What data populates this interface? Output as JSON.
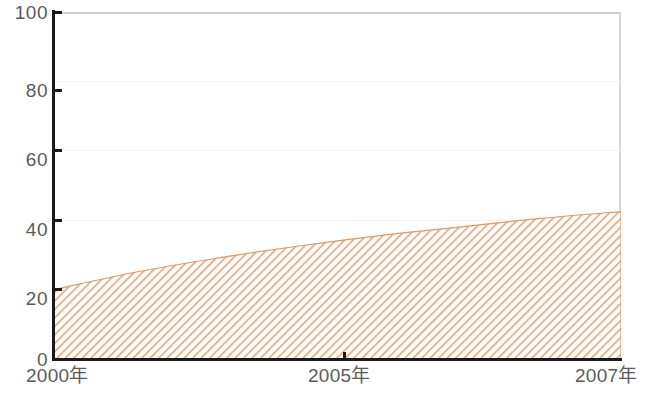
{
  "chart_data": {
    "type": "area",
    "title": "",
    "subtitle": "",
    "xlabel": "",
    "ylabel": "",
    "grid": true,
    "legend": null,
    "xlim": [
      2000,
      2007
    ],
    "ylim": [
      0,
      100
    ],
    "x": [
      2000,
      2001,
      2002,
      2003,
      2004,
      2005,
      2006,
      2007
    ],
    "x_tick_labels": [
      "2000年",
      "2005年",
      "2007年"
    ],
    "x_tick_values": [
      2000,
      2005,
      2007
    ],
    "y_tick_labels": [
      "0",
      "20",
      "40",
      "60",
      "80",
      "100"
    ],
    "y_tick_values": [
      0,
      20,
      40,
      60,
      80,
      100
    ],
    "series": [
      {
        "name": "",
        "values": [
          20,
          25,
          29,
          32.5,
          35.5,
          38,
          40.5,
          42.5
        ],
        "fill_pattern": "diagonal-hatch",
        "color": "#e0a070"
      }
    ]
  },
  "axes": {
    "y_ticks": [
      {
        "label": "100",
        "value": 100
      },
      {
        "label": "80",
        "value": 80
      },
      {
        "label": "60",
        "value": 60
      },
      {
        "label": "40",
        "value": 40
      },
      {
        "label": "20",
        "value": 20
      },
      {
        "label": "0",
        "value": 0
      }
    ],
    "x_ticks": [
      {
        "label": "2000年",
        "value": 2000
      },
      {
        "label": "2005年",
        "value": 2005
      },
      {
        "label": "2007年",
        "value": 2007
      }
    ]
  },
  "colors": {
    "hatch": "#e0a070",
    "hatch_background": "#ffffff",
    "axis": "#1a1a1a",
    "gridline": "#f1f4f6",
    "frame": "#c8cdd1",
    "tick_text": "#5b5b5b"
  }
}
